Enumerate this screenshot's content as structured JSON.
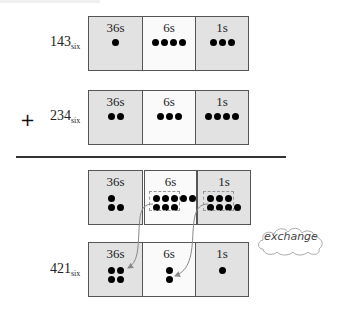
{
  "diagram": {
    "place_headers": [
      "36s",
      "6s",
      "1s"
    ],
    "rows": [
      {
        "id": "addend1",
        "label_main": "143",
        "label_sub": "six",
        "counts": [
          1,
          4,
          3
        ]
      },
      {
        "id": "addend2",
        "operator": "+",
        "label_main": "234",
        "label_sub": "six",
        "counts": [
          2,
          3,
          4
        ]
      },
      {
        "id": "combined",
        "label_main": "",
        "label_sub": "",
        "counts": [
          3,
          8,
          7
        ],
        "grouped_for_exchange": [
          0,
          6,
          6
        ]
      },
      {
        "id": "result",
        "label_main": "421",
        "label_sub": "six",
        "counts": [
          4,
          2,
          1
        ]
      }
    ],
    "annotation": "exchange",
    "arrows": [
      {
        "from": "combined.6s group of 6",
        "to": "result.36s"
      },
      {
        "from": "combined.1s group of 6",
        "to": "result.6s"
      }
    ],
    "colors": {
      "shaded_cell": "#e2e2e2",
      "light_cell": "#fafafa",
      "dot": "#000000",
      "arrow": "#888888"
    }
  }
}
